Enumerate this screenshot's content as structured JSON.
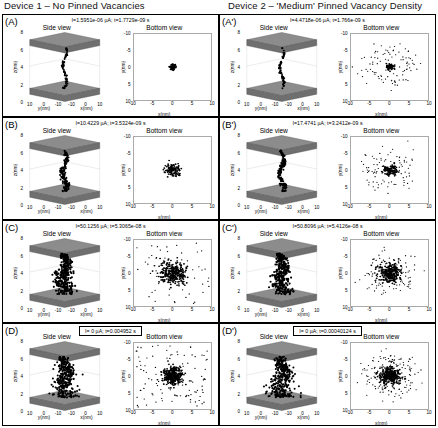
{
  "devices": [
    {
      "id": "device-1",
      "caption": "Device 1 – No Pinned Vacancies"
    },
    {
      "id": "device-2",
      "caption": "Device 2 – 'Medium' Pinned Vacancy Density"
    }
  ],
  "plot_titles": {
    "side": "Side view",
    "bottom": "Bottom view"
  },
  "axis_labels": {
    "x": "x(nm)",
    "y": "y(nm)",
    "z": "z(nm)"
  },
  "side_view": {
    "z_ticks": [
      "8",
      "6",
      "4",
      "2",
      "0"
    ],
    "x_ticks": [
      "-10",
      "0",
      "10"
    ],
    "y_ticks": [
      "10",
      "0",
      "-10"
    ],
    "electrode_color": "#8c8c8c",
    "filament_color": "#000000"
  },
  "bottom_view": {
    "y_ticks": [
      "-10",
      "-5",
      "0",
      "5",
      "10"
    ],
    "x_ticks": [
      "-10",
      "-5",
      "0",
      "5",
      "10"
    ],
    "xlim": [
      -10,
      10
    ],
    "ylim": [
      -10,
      10
    ],
    "dot_color": "#000000"
  },
  "panels": [
    {
      "letter": "(A)",
      "device": 1,
      "boxed_header": false,
      "header": "I=1.5951e-06 µA; t=1.7729e-09 s",
      "current_uA": "1.5951e-06",
      "time_s": "1.7729e-09",
      "filament": "thin-single-narrow",
      "blob_radius": 0.9,
      "blob_count": 55,
      "scatter_count": 0,
      "ring": false
    },
    {
      "letter": "(B)",
      "device": 1,
      "boxed_header": false,
      "header": "I=10.4229 µA; t=3.5324e-09 s",
      "current_uA": "10.4229",
      "time_s": "3.5324e-09",
      "filament": "thin-single-wide",
      "blob_radius": 2.0,
      "blob_count": 120,
      "scatter_count": 0,
      "ring": false
    },
    {
      "letter": "(C)",
      "device": 1,
      "boxed_header": false,
      "header": "I=50.1256 µA; t=5.3065e-08 s",
      "current_uA": "50.1256",
      "time_s": "5.3065e-08",
      "filament": "broad-cluster",
      "blob_radius": 3.4,
      "blob_count": 300,
      "scatter_count": 55,
      "ring": false
    },
    {
      "letter": "(D)",
      "device": 1,
      "boxed_header": true,
      "header": "I=  0   µA; t=0.004952 s",
      "current_uA": "0",
      "time_s": "0.004952",
      "filament": "broad-dispersed",
      "blob_radius": 2.6,
      "blob_count": 330,
      "scatter_count": 110,
      "ring": false
    },
    {
      "letter": "(A')",
      "device": 2,
      "boxed_header": false,
      "header": "I=4.4718e-06 µA; t=1.766e-09 s",
      "current_uA": "4.4718e-06",
      "time_s": "1.766e-09",
      "filament": "thin-single-narrow",
      "blob_radius": 1.1,
      "blob_count": 60,
      "scatter_count": 95,
      "ring": true
    },
    {
      "letter": "(B')",
      "device": 2,
      "boxed_header": false,
      "header": "I=17.4741 µA; t=3.2412e-09 s",
      "current_uA": "17.4741",
      "time_s": "3.2412e-09",
      "filament": "thin-single-wide",
      "blob_radius": 1.8,
      "blob_count": 120,
      "scatter_count": 90,
      "ring": true
    },
    {
      "letter": "(C')",
      "device": 2,
      "boxed_header": false,
      "header": "I=50.8096 µA; t=5.4126e-08 s",
      "current_uA": "50.8096",
      "time_s": "5.4126e-08",
      "filament": "broad-cluster",
      "blob_radius": 3.0,
      "blob_count": 280,
      "scatter_count": 100,
      "ring": true
    },
    {
      "letter": "(D')",
      "device": 2,
      "boxed_header": true,
      "header": "I=  0   µA; t=0.00040124 s",
      "current_uA": "0",
      "time_s": "0.00040124",
      "filament": "broad-dispersed",
      "blob_radius": 2.6,
      "blob_count": 300,
      "scatter_count": 150,
      "ring": true
    }
  ]
}
